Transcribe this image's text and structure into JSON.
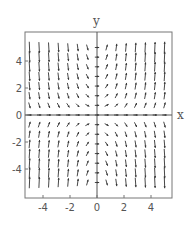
{
  "chart_data": {
    "type": "vector_field",
    "title": "",
    "xlabel": "x",
    "ylabel": "y",
    "xlim": [
      -5.33,
      5.55
    ],
    "ylim": [
      -6.15,
      6.15
    ],
    "grid": false,
    "legend": null,
    "x_ticks": [
      -4,
      -2,
      0,
      2,
      4
    ],
    "y_ticks": [
      -4,
      -2,
      0,
      2,
      4
    ],
    "x_tick_labels": [
      "-4",
      "-2",
      "0",
      "2",
      "4"
    ],
    "y_tick_labels": [
      "-4",
      "-2",
      "0",
      "2",
      "4"
    ],
    "sample_grid": {
      "x_start": -5,
      "x_end": 5,
      "nx": 15,
      "y_start": -5,
      "y_end": 5,
      "ny": 15
    },
    "field_description": "Approximately F(x,y) = (1, x*y): arrows nearly horizontal along the axes, steeply upward in quadrants I and III, steeply downward in quadrants II and IV",
    "field_components": {
      "u": "1",
      "v": "x*y"
    },
    "arrow_color": "#333333",
    "frame_color": "#777777",
    "axis_color": "#555555"
  }
}
